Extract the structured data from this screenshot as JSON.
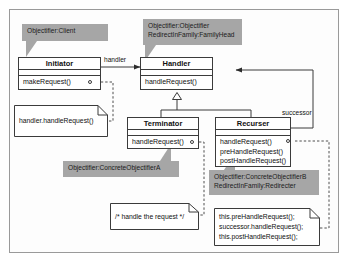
{
  "diagram": {
    "frame_color": "#9a9a9a",
    "callout_color": "#a6a6a6",
    "line_color": "#3b3b3b"
  },
  "classes": {
    "initiator": {
      "name": "Initiator",
      "operations": [
        "makeRequest()"
      ]
    },
    "handler": {
      "name": "Handler",
      "operations": [
        "handleRequest()"
      ]
    },
    "terminator": {
      "name": "Terminator",
      "operations": [
        "handleRequest()"
      ]
    },
    "recurser": {
      "name": "Recurser",
      "operations": [
        "handleRequest()",
        "preHandleRequest()",
        "postHandleRequest()"
      ]
    }
  },
  "callouts": {
    "client": {
      "lines": [
        "Objectifier:Client"
      ]
    },
    "handler_roles": {
      "lines": [
        "Objectifier:Objectifier",
        "RedirectInFamily:FamilyHead"
      ]
    },
    "concrete_a": {
      "lines": [
        "Objectifier:ConcreteObjectifierA"
      ]
    },
    "concrete_b": {
      "lines": [
        "Objectifier:ConcreteObjectifierB",
        "RedirectInFamily:Redirecter"
      ]
    }
  },
  "notes": {
    "initiator_body": {
      "lines": [
        "handler.handleRequest()"
      ]
    },
    "terminator_body": {
      "lines": [
        "/* handle the request */"
      ]
    },
    "recurser_body": {
      "lines": [
        "this.preHandleRequest();",
        "successor.handleRequest();",
        "this.postHandleRequest();"
      ]
    }
  },
  "edges": {
    "handler_role": "handler",
    "successor_role": "successor"
  }
}
